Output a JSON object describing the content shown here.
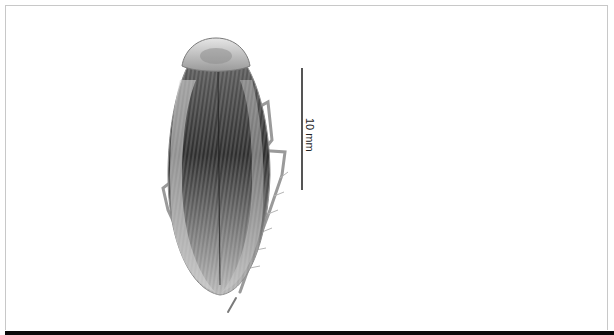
{
  "figure": {
    "views": [
      {
        "name": "dorsal",
        "position": "left"
      },
      {
        "name": "ventral",
        "position": "right"
      }
    ],
    "scale_bar": {
      "label": "10 mm",
      "orientation": "vertical"
    }
  },
  "colors": {
    "background": "#ffffff",
    "frame_border": "#c8c8c8",
    "bottom_bar": "#0a0a0a",
    "specimen_dark": "#2e2e2e",
    "specimen_mid": "#8a8a8a",
    "specimen_light": "#d8d8d8"
  }
}
